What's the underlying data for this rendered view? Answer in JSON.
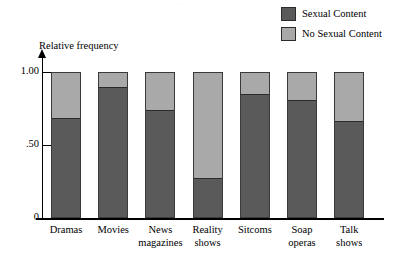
{
  "chart_data": {
    "type": "bar",
    "subtype": "stacked-100-percent",
    "title": "",
    "xlabel": "",
    "ylabel": "Relative frequency",
    "ylim": [
      0,
      1.0
    ],
    "y_ticks": [
      {
        "value": 1.0,
        "label": "1.00"
      },
      {
        "value": 0.5,
        "label": ".50"
      },
      {
        "value": 0.0,
        "label": "0"
      }
    ],
    "grid": false,
    "legend_position": "top-right",
    "categories": [
      "Dramas",
      "Movies",
      "News magazines",
      "Reality shows",
      "Sitcoms",
      "Soap operas",
      "Talk shows"
    ],
    "category_lines": [
      [
        "Dramas"
      ],
      [
        "Movies"
      ],
      [
        "News",
        "magazines"
      ],
      [
        "Reality",
        "shows"
      ],
      [
        "Sitcoms"
      ],
      [
        "Soap",
        "operas"
      ],
      [
        "Talk",
        "shows"
      ]
    ],
    "series": [
      {
        "name": "Sexual Content",
        "color": "#5a5a5a",
        "values": [
          0.68,
          0.89,
          0.73,
          0.27,
          0.84,
          0.8,
          0.66
        ]
      },
      {
        "name": "No Sexual Content",
        "color": "#a9a9a9",
        "values": [
          0.32,
          0.11,
          0.27,
          0.73,
          0.16,
          0.2,
          0.34
        ]
      }
    ]
  },
  "legend": {
    "items": [
      {
        "label": "Sexual Content",
        "color": "#5a5a5a"
      },
      {
        "label": "No Sexual Content",
        "color": "#a9a9a9"
      }
    ]
  },
  "axes": {
    "y_title": "Relative frequency",
    "y_tick_labels": [
      "1.00",
      ".50",
      "0"
    ]
  }
}
